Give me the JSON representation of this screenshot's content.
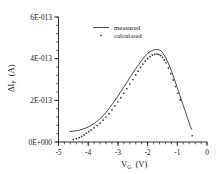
{
  "chart_data": {
    "type": "line",
    "title": "",
    "xlabel": "V_G  (V)",
    "xlabel_main": "V",
    "xlabel_sub": "G",
    "xlabel_unit": "(V)",
    "ylabel": "ΔI_F  (A)",
    "ylabel_main": "ΔI",
    "ylabel_sub": "F",
    "ylabel_unit": "(A)",
    "xlim": [
      -5,
      0
    ],
    "ylim": [
      0,
      6e-13
    ],
    "xticks": [
      -5,
      -4,
      -3,
      -2,
      -1,
      0
    ],
    "xtick_labels": [
      "-5",
      "-4",
      "-3",
      "-2",
      "-1",
      "0"
    ],
    "yticks": [
      0,
      2e-13,
      4e-13,
      6e-13
    ],
    "ytick_labels": [
      "0E+000",
      "2E-013",
      "4E-013",
      "6E-013"
    ],
    "x_minor_per_major": 5,
    "y_minor_per_major": 5,
    "grid": false,
    "legend_position": "upper-center",
    "legend": [
      {
        "name": "measured",
        "marker": "line"
      },
      {
        "name": "calculated",
        "marker": "dot"
      }
    ],
    "series": [
      {
        "name": "measured",
        "marker": "line",
        "x": [
          -4.62,
          -4.5,
          -4.4,
          -4.3,
          -4.2,
          -4.1,
          -4.0,
          -3.9,
          -3.8,
          -3.7,
          -3.6,
          -3.5,
          -3.4,
          -3.3,
          -3.2,
          -3.1,
          -3.0,
          -2.9,
          -2.8,
          -2.7,
          -2.6,
          -2.5,
          -2.4,
          -2.3,
          -2.2,
          -2.1,
          -2.0,
          -1.9,
          -1.8,
          -1.7,
          -1.6,
          -1.55,
          -1.5,
          -1.4,
          -1.3,
          -1.2,
          -1.1,
          -1.0,
          -0.9,
          -0.8,
          -0.7,
          -0.62,
          -0.56,
          -0.52
        ],
        "y": [
          5e-14,
          5.2e-14,
          5.4e-14,
          5.7e-14,
          6.1e-14,
          6.6e-14,
          7.2e-14,
          8e-14,
          8.9e-14,
          1e-13,
          1.12e-13,
          1.26e-13,
          1.42e-13,
          1.6e-13,
          1.8e-13,
          2e-13,
          2.2e-13,
          2.42e-13,
          2.64e-13,
          2.86e-13,
          3.08e-13,
          3.3e-13,
          3.52e-13,
          3.72e-13,
          3.92e-13,
          4.1e-13,
          4.25e-13,
          4.36e-13,
          4.42e-13,
          4.44e-13,
          4.42e-13,
          4.38e-13,
          4.3e-13,
          4.08e-13,
          3.78e-13,
          3.42e-13,
          3.02e-13,
          2.6e-13,
          2.18e-13,
          1.76e-13,
          1.34e-13,
          1e-13,
          7.4e-14,
          6.2e-14
        ]
      },
      {
        "name": "calculated",
        "marker": "dot",
        "x": [
          -4.5,
          -4.4,
          -4.3,
          -4.22,
          -4.14,
          -4.06,
          -3.98,
          -3.9,
          -3.8,
          -3.7,
          -3.6,
          -3.5,
          -3.4,
          -3.3,
          -3.2,
          -3.1,
          -3.0,
          -2.9,
          -2.8,
          -2.7,
          -2.6,
          -2.5,
          -2.4,
          -2.32,
          -2.24,
          -2.16,
          -2.08,
          -2.0,
          -1.92,
          -1.84,
          -1.76,
          -1.68,
          -1.62,
          -1.56,
          -1.5,
          -1.44,
          -1.38,
          -1.3,
          -1.22,
          -1.14,
          -1.06,
          -0.98,
          -0.9,
          -0.5
        ],
        "y": [
          1.2e-14,
          1.6e-14,
          2.1e-14,
          2.7e-14,
          3.4e-14,
          4.2e-14,
          5e-14,
          5.8e-14,
          6.8e-14,
          7.9e-14,
          9.1e-14,
          1.05e-13,
          1.2e-13,
          1.36e-13,
          1.54e-13,
          1.73e-13,
          1.93e-13,
          2.13e-13,
          2.34e-13,
          2.56e-13,
          2.78e-13,
          3e-13,
          3.22e-13,
          3.4e-13,
          3.58e-13,
          3.74e-13,
          3.88e-13,
          4e-13,
          4.1e-13,
          4.17e-13,
          4.21e-13,
          4.22e-13,
          4.2e-13,
          4.15e-13,
          4.06e-13,
          3.94e-13,
          3.8e-13,
          3.56e-13,
          3.28e-13,
          2.98e-13,
          2.66e-13,
          2.34e-13,
          2.02e-13,
          3e-14
        ]
      }
    ]
  }
}
